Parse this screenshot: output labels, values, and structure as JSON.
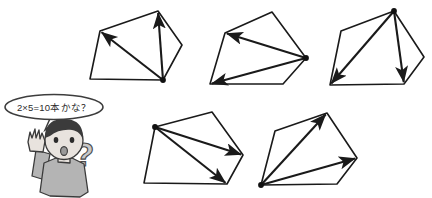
{
  "page": {
    "background_color": "#ffffff",
    "width": 432,
    "height": 198,
    "line_color": "#1a1a1a"
  },
  "character": {
    "name": "boy-thinking",
    "speech_bubble_text": "2×5=10本かな？",
    "hair_color": "#3b3b3b",
    "skin_color": "#e8e3de",
    "shirt_color": "#b4b4b4",
    "question_mark": "?",
    "question_mark_color": "#c8c8c8"
  },
  "figures": [
    {
      "id": "polygon-1",
      "label": "pentagon-1",
      "sides": 5,
      "diagonals_drawn": 2,
      "marked_vertex": "bottom-right",
      "vertices": [
        [
          100,
          31
        ],
        [
          158,
          11
        ],
        [
          182,
          45
        ],
        [
          163,
          80
        ],
        [
          90,
          79
        ]
      ],
      "hub_index": 3,
      "arrow_targets": [
        0,
        1
      ]
    },
    {
      "id": "polygon-2",
      "label": "pentagon-2",
      "sides": 5,
      "diagonals_drawn": 2,
      "marked_vertex": "right",
      "vertices": [
        [
          225,
          33
        ],
        [
          272,
          12
        ],
        [
          306,
          58
        ],
        [
          283,
          84
        ],
        [
          210,
          84
        ]
      ],
      "hub_index": 2,
      "arrow_targets": [
        0,
        4
      ]
    },
    {
      "id": "polygon-3",
      "label": "pentagon-3",
      "sides": 5,
      "diagonals_drawn": 2,
      "marked_vertex": "top",
      "vertices": [
        [
          341,
          31
        ],
        [
          394,
          11
        ],
        [
          424,
          57
        ],
        [
          404,
          84
        ],
        [
          330,
          85
        ]
      ],
      "hub_index": 1,
      "arrow_targets": [
        4,
        3
      ]
    },
    {
      "id": "polygon-4",
      "label": "pentagon-4",
      "sides": 5,
      "diagonals_drawn": 2,
      "marked_vertex": "upper-left",
      "vertices": [
        [
          155,
          127
        ],
        [
          212,
          112
        ],
        [
          243,
          155
        ],
        [
          227,
          184
        ],
        [
          144,
          183
        ]
      ],
      "hub_index": 0,
      "arrow_targets": [
        2,
        3
      ]
    },
    {
      "id": "polygon-5",
      "label": "pentagon-5",
      "sides": 5,
      "diagonals_drawn": 2,
      "marked_vertex": "bottom-left",
      "vertices": [
        [
          275,
          131
        ],
        [
          327,
          113
        ],
        [
          357,
          158
        ],
        [
          337,
          184
        ],
        [
          261,
          185
        ]
      ],
      "hub_index": 4,
      "arrow_targets": [
        1,
        2
      ]
    }
  ]
}
